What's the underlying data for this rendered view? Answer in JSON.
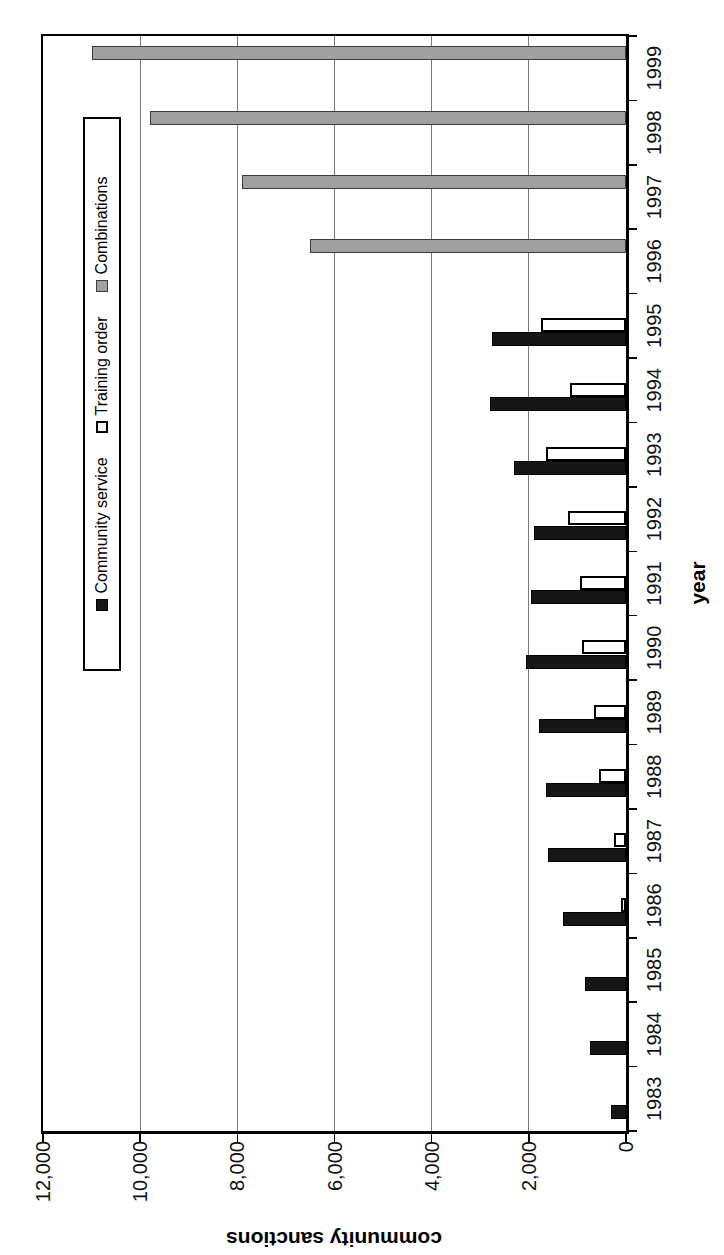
{
  "page": {
    "background": "#ffffff"
  },
  "chart_data": {
    "type": "bar",
    "title": "",
    "xlabel": "year",
    "ylabel": "community sanctions",
    "categories": [
      "1983",
      "1984",
      "1985",
      "1986",
      "1987",
      "1988",
      "1989",
      "1990",
      "1991",
      "1992",
      "1993",
      "1994",
      "1995",
      "1996",
      "1997",
      "1998",
      "1999"
    ],
    "series": [
      {
        "name": "Community service",
        "fill": "#161616",
        "border": "#000000",
        "values": [
          300,
          750,
          850,
          1300,
          1600,
          1650,
          1800,
          2050,
          1950,
          1900,
          2300,
          2800,
          2750,
          null,
          null,
          null,
          null
        ]
      },
      {
        "name": "Training order",
        "fill": "#ffffff",
        "border": "#000000",
        "values": [
          null,
          null,
          null,
          100,
          250,
          550,
          650,
          900,
          950,
          1200,
          1650,
          1150,
          1750,
          null,
          null,
          null,
          null
        ]
      },
      {
        "name": "Combinations",
        "fill": "#a0a0a0",
        "border": "#3c3c3c",
        "values": [
          null,
          null,
          null,
          null,
          null,
          null,
          null,
          null,
          null,
          null,
          null,
          null,
          null,
          6500,
          7900,
          9800,
          11000
        ]
      }
    ],
    "ylim": [
      0,
      12000
    ],
    "ytick_interval": 2000,
    "ytick_labels": [
      "0",
      "2,000",
      "4,000",
      "6,000",
      "8,000",
      "10,000",
      "12,000"
    ],
    "grid": true,
    "gridline_color": "#7a7a7a",
    "legend_position": "inside-top-right",
    "rendered_rotation_deg": -90
  }
}
